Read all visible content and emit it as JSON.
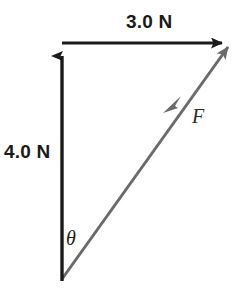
{
  "diagram": {
    "background_color": "#ffffff",
    "labels": {
      "horizontal_component": "3.0 N",
      "vertical_component": "4.0 N",
      "angle_symbol": "θ",
      "resultant_symbol": "F"
    },
    "colors": {
      "component_vector": "#1a1a1a",
      "resultant_vector": "#6a6a6a",
      "text": "#1a1a1a"
    },
    "geometry": {
      "origin": {
        "x": 62,
        "y": 280
      },
      "top_left": {
        "x": 62,
        "y": 45
      },
      "top_right": {
        "x": 233,
        "y": 43
      }
    },
    "vectors": [
      {
        "name": "vertical-component-vector",
        "label": "4.0 N",
        "magnitude": 4.0,
        "unit": "N",
        "direction": "up",
        "color": "#1a1a1a",
        "from": {
          "x": 62,
          "y": 280
        },
        "to": {
          "x": 62,
          "y": 45
        }
      },
      {
        "name": "horizontal-component-vector",
        "label": "3.0 N",
        "magnitude": 3.0,
        "unit": "N",
        "direction": "right",
        "color": "#1a1a1a",
        "from": {
          "x": 62,
          "y": 43
        },
        "to": {
          "x": 233,
          "y": 43
        }
      },
      {
        "name": "resultant-force-vector",
        "label": "F",
        "direction": "up-right",
        "color": "#6a6a6a",
        "from": {
          "x": 62,
          "y": 280
        },
        "to": {
          "x": 233,
          "y": 43
        }
      }
    ],
    "angle": {
      "name": "theta-angle",
      "label": "θ",
      "vertex": {
        "x": 62,
        "y": 280
      },
      "between": [
        "vertical-component-vector",
        "resultant-force-vector"
      ]
    }
  }
}
